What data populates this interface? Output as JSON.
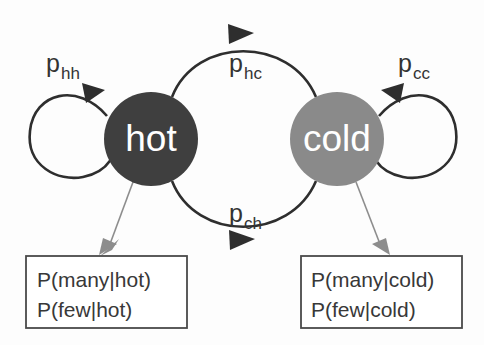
{
  "diagram": {
    "type": "markov-chain-state-diagram",
    "background_color": "#fdfdfd",
    "states": [
      {
        "id": "hot",
        "label": "hot",
        "fill_color": "#3f3f3f",
        "text_color": "#ffffff",
        "cx": 151,
        "cy": 139,
        "r": 47
      },
      {
        "id": "cold",
        "label": "cold",
        "fill_color": "#8a8a8a",
        "text_color": "#ffffff",
        "cx": 337,
        "cy": 139,
        "r": 47
      }
    ],
    "transitions": [
      {
        "id": "hh",
        "label_base": "p",
        "label_sub": "hh",
        "from": "hot",
        "to": "hot",
        "kind": "self-loop",
        "label_x": 46,
        "label_y": 72
      },
      {
        "id": "hc",
        "label_base": "p",
        "label_sub": "hc",
        "from": "hot",
        "to": "cold",
        "kind": "arc-top",
        "label_x": 229,
        "label_y": 72
      },
      {
        "id": "ch",
        "label_base": "p",
        "label_sub": "ch",
        "from": "cold",
        "to": "hot",
        "kind": "arc-bottom",
        "label_x": 229,
        "label_y": 222
      },
      {
        "id": "cc",
        "label_base": "p",
        "label_sub": "cc",
        "from": "cold",
        "to": "cold",
        "kind": "self-loop",
        "label_x": 398,
        "label_y": 72
      }
    ],
    "emission_boxes": [
      {
        "id": "hot-emissions",
        "state": "hot",
        "x": 26,
        "y": 256,
        "width": 161,
        "height": 72,
        "lines": [
          "P(many|hot)",
          "P(few|hot)"
        ]
      },
      {
        "id": "cold-emissions",
        "state": "cold",
        "x": 301,
        "y": 256,
        "width": 161,
        "height": 72,
        "lines": [
          "P(many|cold)",
          "P(few|cold)"
        ]
      }
    ],
    "colors": {
      "edge_stroke": "#2e2e2e",
      "emit_arrow_stroke": "#8d8d8d",
      "box_stroke": "#4a4a4a",
      "label_text": "#333333",
      "emission_text": "#383838"
    }
  }
}
